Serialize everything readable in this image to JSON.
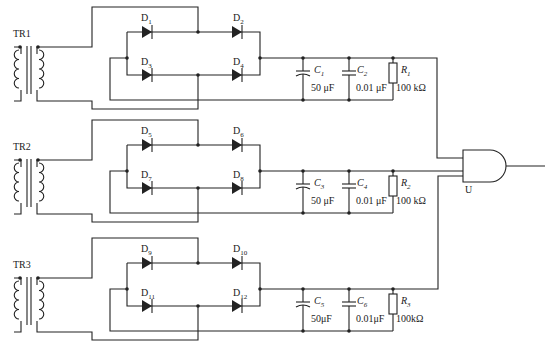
{
  "stages": [
    {
      "transformer": "TR1",
      "diodes": [
        "D1",
        "D2",
        "D3",
        "D4"
      ],
      "cap_big": {
        "name": "C1",
        "value": "50 μF"
      },
      "cap_small": {
        "name": "C2",
        "value": "0.01 μF"
      },
      "resistor": {
        "name": "R1",
        "value": "100 kΩ"
      }
    },
    {
      "transformer": "TR2",
      "diodes": [
        "D5",
        "D6",
        "D7",
        "D8"
      ],
      "cap_big": {
        "name": "C3",
        "value": "50 μF"
      },
      "cap_small": {
        "name": "C4",
        "value": "0.01 μF"
      },
      "resistor": {
        "name": "R2",
        "value": "100 kΩ"
      }
    },
    {
      "transformer": "TR3",
      "diodes": [
        "D9",
        "D10",
        "D11",
        "D12"
      ],
      "cap_big": {
        "name": "C5",
        "value": "50μF"
      },
      "cap_small": {
        "name": "C6",
        "value": "0.01μF"
      },
      "resistor": {
        "name": "R3",
        "value": "100kΩ"
      }
    }
  ],
  "gate": {
    "name": "U",
    "type": "AND"
  },
  "colors": {
    "line": "#222222",
    "background": "#ffffff"
  }
}
